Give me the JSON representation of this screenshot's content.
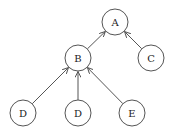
{
  "diagram": {
    "type": "tree",
    "nodes": [
      {
        "id": "A",
        "label": "A",
        "x": 115,
        "y": 22
      },
      {
        "id": "B",
        "label": "B",
        "x": 78,
        "y": 58
      },
      {
        "id": "C",
        "label": "C",
        "x": 151,
        "y": 58
      },
      {
        "id": "D1",
        "label": "D",
        "x": 23,
        "y": 113
      },
      {
        "id": "D2",
        "label": "D",
        "x": 78,
        "y": 113
      },
      {
        "id": "E",
        "label": "E",
        "x": 132,
        "y": 113
      }
    ],
    "edges": [
      {
        "from": "B",
        "to": "A"
      },
      {
        "from": "C",
        "to": "A"
      },
      {
        "from": "D1",
        "to": "B"
      },
      {
        "from": "D2",
        "to": "B"
      },
      {
        "from": "E",
        "to": "B"
      }
    ],
    "node_radius": 13
  }
}
